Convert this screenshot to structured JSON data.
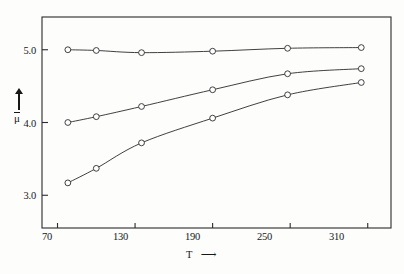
{
  "figure": {
    "background_color": "#fdfdfc",
    "line_color": "#2b2b2b",
    "marker_face_color": "#ffffff"
  },
  "axes": {
    "y_axis_title": "μ",
    "y_axis_arrow": "↑",
    "x_axis_title": "T",
    "x_axis_arrow": "⟶",
    "y_ticks": [
      {
        "label": "3.0",
        "value": 3.0
      },
      {
        "label": "4.0",
        "value": 4.0
      },
      {
        "label": "5.0",
        "value": 5.0
      }
    ],
    "x_ticks": [
      {
        "label": "70",
        "value": 70
      },
      {
        "label": "130",
        "value": 130
      },
      {
        "label": "190",
        "value": 190
      },
      {
        "label": "250",
        "value": 250
      },
      {
        "label": "310",
        "value": 310
      }
    ]
  },
  "chart_data": {
    "type": "line",
    "title": "",
    "subtitle": "",
    "xlabel": "T",
    "ylabel": "μ",
    "xlim": [
      58,
      328
    ],
    "ylim": [
      2.55,
      5.45
    ],
    "grid": false,
    "legend": "none",
    "marker": "open-circle",
    "x": [
      78,
      100,
      135,
      190,
      248,
      305
    ],
    "series": [
      {
        "name": "upper curve",
        "values": [
          5.0,
          4.99,
          4.96,
          4.98,
          5.02,
          5.03
        ]
      },
      {
        "name": "middle curve",
        "values": [
          4.0,
          4.08,
          4.22,
          4.45,
          4.67,
          4.74
        ]
      },
      {
        "name": "lower curve",
        "values": [
          3.17,
          3.37,
          3.72,
          4.06,
          4.38,
          4.55
        ]
      }
    ]
  }
}
